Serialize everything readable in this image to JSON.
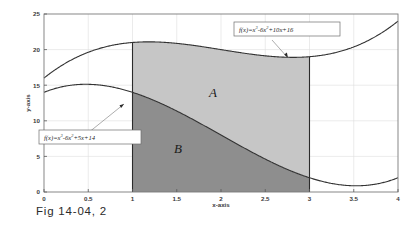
{
  "figure": {
    "caption": "Fig 14-04, 2"
  },
  "chart_data": {
    "type": "line",
    "title": "",
    "xlabel": "x-axis",
    "ylabel": "y-axis",
    "xlim": [
      0,
      4
    ],
    "ylim": [
      0,
      25
    ],
    "grid": true,
    "legend_position": "none",
    "x_ticks": [
      "0",
      "0.5",
      "1",
      "1.5",
      "2",
      "2.5",
      "3",
      "3.5",
      "4"
    ],
    "x_tick_values": [
      0,
      0.5,
      1,
      1.5,
      2,
      2.5,
      3,
      3.5,
      4
    ],
    "y_ticks": [
      "0",
      "5",
      "10",
      "15",
      "20",
      "25"
    ],
    "y_tick_values": [
      0,
      5,
      10,
      15,
      20,
      25
    ],
    "series": [
      {
        "name": "upper-curve",
        "equation": "f(x)=x^3-6x^2+10x+16",
        "color": "#333333",
        "x": [
          0,
          0.25,
          0.5,
          0.75,
          1,
          1.25,
          1.5,
          1.75,
          2,
          2.25,
          2.5,
          2.75,
          3,
          3.25,
          3.5,
          3.75,
          4
        ],
        "values": [
          16,
          18.14,
          19.63,
          20.55,
          21,
          21.07,
          20.88,
          19.98,
          20,
          19.52,
          19.13,
          18.92,
          19,
          19.45,
          20.38,
          21.86,
          24
        ]
      },
      {
        "name": "lower-curve",
        "equation": "f(x)=x^3-6x^2+5x+14",
        "color": "#333333",
        "x": [
          0,
          0.25,
          0.5,
          0.75,
          1,
          1.25,
          1.5,
          1.75,
          2,
          2.25,
          2.5,
          2.75,
          3,
          3.25,
          3.5,
          3.75,
          4
        ],
        "values": [
          14,
          14.89,
          15.13,
          14.8,
          14,
          12.82,
          11.38,
          9.73,
          8,
          6.27,
          4.63,
          3.17,
          2,
          1.2,
          1.13,
          1.11,
          2
        ]
      }
    ],
    "shaded_regions": [
      {
        "label": "A",
        "color": "#c6c6c6",
        "description": "area between upper-curve and lower-curve",
        "x_start": 1,
        "x_end": 3
      },
      {
        "label": "B",
        "color": "#8e8e8e",
        "description": "area under lower-curve",
        "x_start": 1,
        "x_end": 3
      }
    ],
    "annotations": [
      {
        "name": "upper-equation-callout",
        "text": "f(x)=x3-6x2+10x+16",
        "lhs": "f(x)=",
        "term1": "x",
        "exp1": "3",
        "term2": "-6x",
        "exp2": "2",
        "term3": "+10x+16",
        "points_to_series": "upper-curve",
        "points_to_x": 2.72
      },
      {
        "name": "lower-equation-callout",
        "text": "f(x)=x3-6x2+5x+14",
        "lhs": "f(x)=",
        "term1": "x",
        "exp1": "3",
        "term2": "-6x",
        "exp2": "2",
        "term3": "+5x+14",
        "points_to_series": "lower-curve",
        "points_to_x": 0.92
      }
    ]
  }
}
